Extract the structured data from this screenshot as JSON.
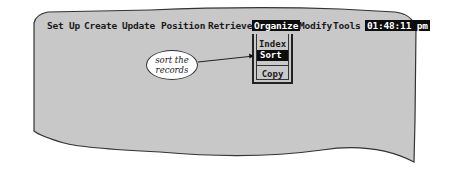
{
  "menubar": {
    "items": [
      {
        "label": "Set Up"
      },
      {
        "label": "Create"
      },
      {
        "label": "Update"
      },
      {
        "label": "Position"
      },
      {
        "label": "Retrieve"
      },
      {
        "label": "Organize",
        "active": true
      },
      {
        "label": "Modify"
      },
      {
        "label": "Tools"
      }
    ],
    "clock": "01:48:11 pm"
  },
  "dropdown": {
    "items": [
      {
        "label": "Index"
      },
      {
        "label": "Sort",
        "selected": true
      },
      {
        "label": "Copy"
      }
    ]
  },
  "callout": {
    "line1": "sort the",
    "line2": "records"
  },
  "colors": {
    "screen": "#c8c8c8",
    "highlight": "#0d0d0d",
    "highlight_text": "#ffffff",
    "callout_bg": "#ffffff",
    "border": "#333333"
  }
}
